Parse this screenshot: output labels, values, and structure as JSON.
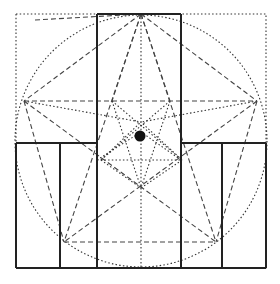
{
  "diagram": {
    "outer_square": {
      "x1": 16,
      "y1": 14,
      "x2": 266,
      "y2": 268,
      "style": "dotted"
    },
    "circle": {
      "cx": 141,
      "cy": 141,
      "r": 126,
      "style": "dotted"
    },
    "thick_lines": [
      {
        "x1": 97,
        "y1": 14,
        "x2": 181,
        "y2": 14
      },
      {
        "x1": 97,
        "y1": 14,
        "x2": 97,
        "y2": 268
      },
      {
        "x1": 181,
        "y1": 14,
        "x2": 181,
        "y2": 268
      },
      {
        "x1": 16,
        "y1": 143,
        "x2": 97,
        "y2": 143
      },
      {
        "x1": 181,
        "y1": 143,
        "x2": 266,
        "y2": 143
      },
      {
        "x1": 16,
        "y1": 143,
        "x2": 16,
        "y2": 268
      },
      {
        "x1": 266,
        "y1": 143,
        "x2": 266,
        "y2": 268
      },
      {
        "x1": 16,
        "y1": 268,
        "x2": 266,
        "y2": 268
      },
      {
        "x1": 60,
        "y1": 143,
        "x2": 60,
        "y2": 268
      },
      {
        "x1": 222,
        "y1": 143,
        "x2": 222,
        "y2": 268
      }
    ],
    "pentagram_vertices": [
      [
        141,
        14
      ],
      [
        257,
        101
      ],
      [
        216,
        240
      ],
      [
        64,
        242
      ],
      [
        24,
        101
      ]
    ],
    "inner_points": [
      [
        112,
        101
      ],
      [
        170,
        101
      ],
      [
        140,
        122
      ],
      [
        101,
        160
      ],
      [
        182,
        160
      ],
      [
        141,
        188
      ]
    ],
    "dashed_lines": [
      {
        "x1": 24,
        "y1": 101,
        "x2": 257,
        "y2": 101
      },
      {
        "x1": 64,
        "y1": 242,
        "x2": 216,
        "y2": 242
      },
      {
        "x1": 141,
        "y1": 14,
        "x2": 24,
        "y2": 101
      },
      {
        "x1": 141,
        "y1": 14,
        "x2": 257,
        "y2": 101
      },
      {
        "x1": 141,
        "y1": 14,
        "x2": 64,
        "y2": 242
      },
      {
        "x1": 141,
        "y1": 14,
        "x2": 216,
        "y2": 242
      },
      {
        "x1": 24,
        "y1": 101,
        "x2": 216,
        "y2": 242
      },
      {
        "x1": 257,
        "y1": 101,
        "x2": 64,
        "y2": 242
      },
      {
        "x1": 24,
        "y1": 101,
        "x2": 64,
        "y2": 242
      },
      {
        "x1": 257,
        "y1": 101,
        "x2": 216,
        "y2": 242
      },
      {
        "x1": 141,
        "y1": 14,
        "x2": 112,
        "y2": 101
      },
      {
        "x1": 141,
        "y1": 14,
        "x2": 170,
        "y2": 101
      },
      {
        "x1": 35,
        "y1": 20,
        "x2": 141,
        "y2": 14
      }
    ],
    "dotted_lines": [
      {
        "x1": 141,
        "y1": 14,
        "x2": 141,
        "y2": 268
      },
      {
        "x1": 97,
        "y1": 160,
        "x2": 181,
        "y2": 160
      },
      {
        "x1": 112,
        "y1": 101,
        "x2": 182,
        "y2": 160
      },
      {
        "x1": 170,
        "y1": 101,
        "x2": 101,
        "y2": 160
      },
      {
        "x1": 112,
        "y1": 101,
        "x2": 141,
        "y2": 188
      },
      {
        "x1": 170,
        "y1": 101,
        "x2": 141,
        "y2": 188
      },
      {
        "x1": 101,
        "y1": 160,
        "x2": 141,
        "y2": 122
      },
      {
        "x1": 182,
        "y1": 160,
        "x2": 141,
        "y2": 122
      },
      {
        "x1": 24,
        "y1": 101,
        "x2": 141,
        "y2": 122
      },
      {
        "x1": 257,
        "y1": 101,
        "x2": 141,
        "y2": 122
      },
      {
        "x1": 101,
        "y1": 160,
        "x2": 141,
        "y2": 188
      },
      {
        "x1": 182,
        "y1": 160,
        "x2": 141,
        "y2": 188
      },
      {
        "x1": 97,
        "y1": 160,
        "x2": 141,
        "y2": 132
      },
      {
        "x1": 181,
        "y1": 160,
        "x2": 141,
        "y2": 132
      }
    ],
    "center_dot": {
      "cx": 140,
      "cy": 136,
      "r": 5.5
    },
    "colors": {
      "line": "#333333",
      "background": "#ffffff",
      "dot": "#111111"
    }
  }
}
